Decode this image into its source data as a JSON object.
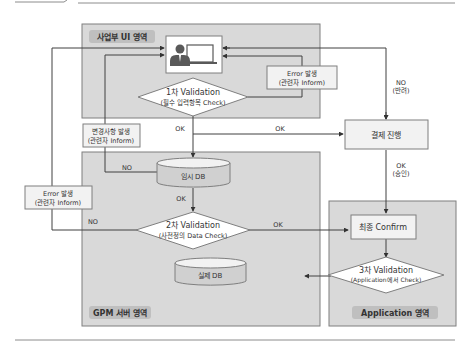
{
  "colors": {
    "panel_fill": "#d9d9d9",
    "panel_stroke": "#7f7f7f",
    "zone_tag_fill": "#bfbfbf",
    "box_fill": "#f2f2f2",
    "white": "#ffffff",
    "line": "#404040",
    "user_icon": "#595959"
  },
  "zones": {
    "ui": {
      "label": "사업부 UI 영역"
    },
    "gpm": {
      "label": "GPM 서버 영역"
    },
    "app": {
      "label": "Application 영역"
    }
  },
  "nodes": {
    "user": {
      "icon": "user-with-monitor-icon"
    },
    "validation1": {
      "line1": "1차 Validation",
      "line2": "(필수 입력항목 Check)"
    },
    "error_top": {
      "line1": "Error 발생",
      "line2": "(관련자 Inform)"
    },
    "change_notice": {
      "line1": "변경사항 발생",
      "line2": "(관련자 Inform)"
    },
    "temp_db": {
      "label": "임시 DB"
    },
    "error_left": {
      "line1": "Error 발생",
      "line2": "(관련자 Inform)"
    },
    "validation2": {
      "line1": "2차 Validation",
      "line2": "(사전정의 Data Check)"
    },
    "real_db": {
      "label": "실제 DB"
    },
    "payment": {
      "label": "결제 진행"
    },
    "final_confirm": {
      "label": "최종 Confirm"
    },
    "validation3": {
      "line1": "3차 Validation",
      "line2": "(Application에서 Check)"
    }
  },
  "edges": {
    "v1_ok_down": "OK",
    "v1_ok_right": "OK",
    "tempdb_no": "NO",
    "tempdb_ok": "OK",
    "v2_no": "NO",
    "v2_ok": "OK",
    "payment_no": {
      "line1": "NO",
      "line2": "(반려)"
    },
    "payment_ok": {
      "line1": "OK",
      "line2": "(승인)"
    }
  }
}
